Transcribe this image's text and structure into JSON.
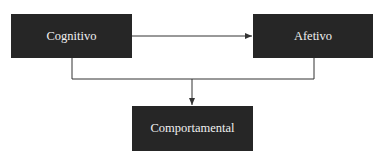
{
  "diagram": {
    "nodes": [
      {
        "id": "cognitivo",
        "label": "Cognitivo"
      },
      {
        "id": "afetivo",
        "label": "Afetivo"
      },
      {
        "id": "comportamental",
        "label": "Comportamental"
      }
    ],
    "edges": [
      {
        "from": "cognitivo",
        "to": "afetivo"
      },
      {
        "from": "cognitivo",
        "to": "comportamental"
      },
      {
        "from": "afetivo",
        "to": "comportamental"
      }
    ],
    "colors": {
      "box_fill": "#262626",
      "box_text": "#f0f0f0",
      "line": "#333333"
    }
  }
}
